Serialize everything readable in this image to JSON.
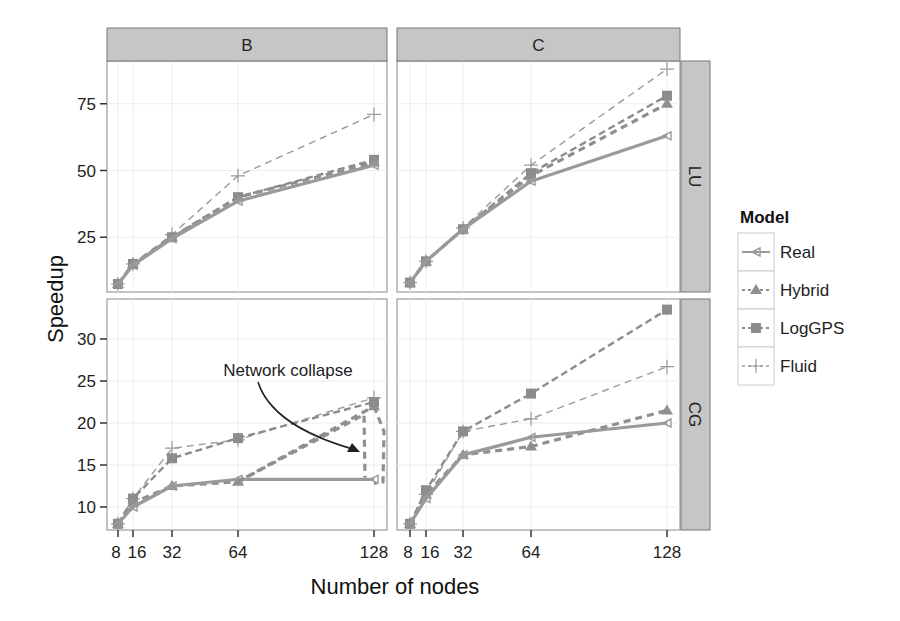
{
  "chart_data": {
    "type": "line",
    "title": "",
    "xlabel": "Number of nodes",
    "ylabel": "Speedup",
    "x": [
      8,
      16,
      32,
      64,
      128
    ],
    "x_tick_labels": [
      "8",
      "16",
      "32",
      "64",
      "128"
    ],
    "column_facets": [
      "B",
      "C"
    ],
    "row_facets": [
      "LU",
      "CG"
    ],
    "legend": {
      "title": "Model",
      "position": "right",
      "entries": [
        {
          "name": "Real",
          "linetype": "solid",
          "marker": "left-triangle",
          "color": "#8c8c8c"
        },
        {
          "name": "Hybrid",
          "linetype": "dashed",
          "marker": "triangle",
          "color": "#8c8c8c"
        },
        {
          "name": "LogGPS",
          "linetype": "dashed",
          "marker": "square",
          "color": "#8c8c8c"
        },
        {
          "name": "Fluid",
          "linetype": "dashed-thin",
          "marker": "plus",
          "color": "#8c8c8c"
        }
      ]
    },
    "grid": true,
    "annotation": {
      "text": "Network collapse",
      "panel": "CG-B",
      "points_to_x": 128
    },
    "panels": [
      {
        "row": "LU",
        "col": "B",
        "ylim": [
          4.5,
          91
        ],
        "yticks": [
          25,
          50,
          75
        ],
        "series": [
          {
            "name": "Real",
            "values": [
              7.5,
              14.5,
              24.5,
              38.5,
              52
            ]
          },
          {
            "name": "Hybrid",
            "values": [
              7.5,
              15,
              25,
              40,
              53
            ]
          },
          {
            "name": "LogGPS",
            "values": [
              7.5,
              15,
              25,
              40,
              54
            ]
          },
          {
            "name": "Fluid",
            "values": [
              7.5,
              15,
              26,
              48,
              71
            ]
          }
        ]
      },
      {
        "row": "LU",
        "col": "C",
        "ylim": [
          4.5,
          91
        ],
        "yticks": [
          25,
          50,
          75
        ],
        "series": [
          {
            "name": "Real",
            "values": [
              8,
              16,
              28,
              46,
              63
            ]
          },
          {
            "name": "Hybrid",
            "values": [
              8,
              16,
              28,
              48,
              75
            ]
          },
          {
            "name": "LogGPS",
            "values": [
              8,
              16,
              28,
              49,
              78
            ]
          },
          {
            "name": "Fluid",
            "values": [
              8,
              16,
              28.5,
              52,
              88
            ]
          }
        ]
      },
      {
        "row": "CG",
        "col": "B",
        "ylim": [
          7,
          34.5
        ],
        "yticks": [
          10,
          15,
          20,
          25,
          30
        ],
        "series": [
          {
            "name": "Real",
            "values": [
              8,
              10,
              12.5,
              13.3,
              13.3
            ]
          },
          {
            "name": "Hybrid",
            "values": [
              8,
              10.5,
              12.5,
              13,
              22
            ]
          },
          {
            "name": "LogGPS",
            "values": [
              8,
              11,
              15.8,
              18.2,
              22.5
            ]
          },
          {
            "name": "Fluid",
            "values": [
              8,
              11,
              17,
              18,
              23
            ]
          }
        ]
      },
      {
        "row": "CG",
        "col": "C",
        "ylim": [
          7,
          34.5
        ],
        "yticks": [
          10,
          15,
          20,
          25,
          30
        ],
        "series": [
          {
            "name": "Real",
            "values": [
              8,
              11,
              16.2,
              18.3,
              20
            ]
          },
          {
            "name": "Hybrid",
            "values": [
              8,
              11.5,
              16.2,
              17.2,
              21.5
            ]
          },
          {
            "name": "LogGPS",
            "values": [
              8,
              12,
              19,
              23.5,
              33.5
            ]
          },
          {
            "name": "Fluid",
            "values": [
              8,
              11.5,
              19,
              20.5,
              26.7
            ]
          }
        ]
      }
    ]
  }
}
